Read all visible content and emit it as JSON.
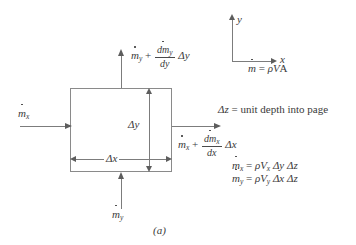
{
  "figure": {
    "caption": "(a)",
    "type": "differential-control-volume-mass-flux-diagram"
  },
  "axes": {
    "y_label": "y",
    "x_label": "x"
  },
  "flows": {
    "inlet_x": {
      "symbol": "m",
      "subscript": "x"
    },
    "inlet_y": {
      "symbol": "m",
      "subscript": "y"
    },
    "outlet_y": {
      "base_symbol": "m",
      "base_subscript": "y",
      "plus": "+",
      "numerator_symbol": "dm",
      "numerator_subscript": "y",
      "denominator": "dy",
      "delta": "Δy"
    },
    "outlet_x": {
      "base_symbol": "m",
      "base_subscript": "x",
      "plus": "+",
      "numerator_symbol": "dm",
      "numerator_subscript": "x",
      "denominator": "dx",
      "delta": "Δx"
    }
  },
  "dimensions": {
    "delta_y": "Δy",
    "delta_x": "Δx"
  },
  "notes": {
    "mass_flow_definition": {
      "lhs_symbol": "m",
      "equals": "=",
      "rhs": "ρ",
      "velocity": "V",
      "area": "A"
    },
    "depth_note": {
      "symbol": "Δz",
      "text": "= unit depth into page"
    },
    "mx_equation": {
      "lhs_symbol": "m",
      "lhs_subscript": "x",
      "equals": "=",
      "rho": "ρ",
      "velocity": "V",
      "velocity_subscript": "x",
      "term1": "Δy",
      "term2": "Δz"
    },
    "my_equation": {
      "lhs_symbol": "m",
      "lhs_subscript": "y",
      "equals": "=",
      "rho": "ρ",
      "velocity": "V",
      "velocity_subscript": "y",
      "term1": "Δx",
      "term2": "Δz"
    }
  },
  "colors": {
    "stroke": "#8a8a8a",
    "arrow": "#5d5d5d",
    "text": "#3a3a3a",
    "background": "#ffffff"
  }
}
